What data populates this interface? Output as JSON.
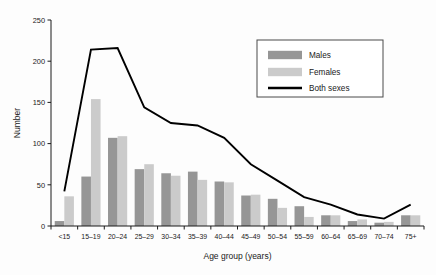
{
  "chart_data": {
    "type": "bar",
    "title": "",
    "xlabel": "Age group (years)",
    "ylabel": "Number",
    "ylim": [
      0,
      250
    ],
    "yticks": [
      0,
      50,
      100,
      150,
      200,
      250
    ],
    "grid": false,
    "legend_position": "top-right",
    "categories": [
      "<15",
      "15–19",
      "20–24",
      "25–29",
      "30–34",
      "35–39",
      "40–44",
      "45–49",
      "50–54",
      "55–59",
      "60–64",
      "65–69",
      "70–74",
      "75+"
    ],
    "series": [
      {
        "name": "Males",
        "kind": "bar",
        "color": "#969696",
        "values": [
          6,
          60,
          107,
          69,
          64,
          66,
          54,
          37,
          33,
          24,
          13,
          6,
          4,
          13
        ]
      },
      {
        "name": "Females",
        "kind": "bar",
        "color": "#cbcbcb",
        "values": [
          36,
          154,
          109,
          75,
          61,
          56,
          53,
          38,
          22,
          11,
          13,
          8,
          5,
          13
        ]
      },
      {
        "name": "Both sexes",
        "kind": "line",
        "color": "#000000",
        "values": [
          42,
          214,
          216,
          144,
          125,
          122,
          107,
          75,
          55,
          35,
          26,
          14,
          9,
          26
        ]
      }
    ]
  },
  "legend": {
    "items": [
      {
        "label": "Males",
        "marker": "swatch-dark"
      },
      {
        "label": "Females",
        "marker": "swatch-light"
      },
      {
        "label": "Both sexes",
        "marker": "line-black"
      }
    ]
  }
}
